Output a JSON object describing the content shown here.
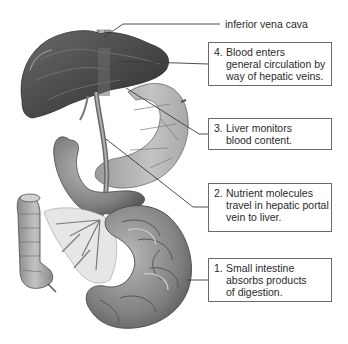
{
  "diagram": {
    "top_label": "inferior vena cava",
    "callouts": [
      {
        "number": "4.",
        "lines": [
          "Blood enters",
          "general circulation by",
          "way of hepatic veins."
        ]
      },
      {
        "number": "3.",
        "lines": [
          "Liver monitors",
          "blood content."
        ]
      },
      {
        "number": "2.",
        "lines": [
          "Nutrient molecules",
          "travel in hepatic portal",
          "vein to liver."
        ]
      },
      {
        "number": "1.",
        "lines": [
          "Small intestine",
          "absorbs products",
          "of digestion."
        ]
      }
    ],
    "organs": [
      "liver",
      "inferior vena cava",
      "stomach",
      "hepatic portal vein",
      "duodenum",
      "small intestine",
      "large intestine (colon)"
    ],
    "colors": {
      "liver": "#4a4a4a",
      "organ_mid": "#8c8c8c",
      "organ_light": "#c8c8c8",
      "vessel": "#7a7a7a",
      "leader_line": "#3a3a3a",
      "box_border": "#6a6a6a",
      "text": "#2a2a2a"
    }
  }
}
